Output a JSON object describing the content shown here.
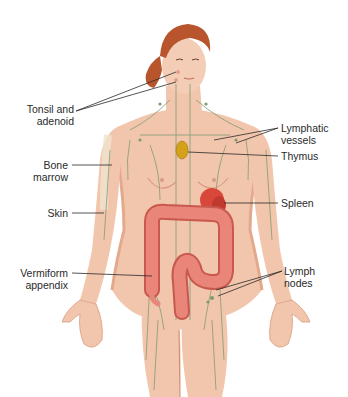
{
  "diagram": {
    "colors": {
      "skin": "#f2c6ad",
      "skin_shadow": "#e4a98c",
      "hair": "#b8552c",
      "vessel": "#7e9a72",
      "colon": "#e98579",
      "colon_dark": "#c9584e",
      "spleen": "#d9473b",
      "thymus": "#d4a21a",
      "bone": "#efe3cf",
      "leader_line": "#2a2a2a"
    },
    "labels_left": [
      {
        "id": "tonsil-adenoid",
        "text": "Tonsil and\nadenoid"
      },
      {
        "id": "bone-marrow",
        "text": "Bone\nmarrow"
      },
      {
        "id": "skin",
        "text": "Skin"
      },
      {
        "id": "vermiform-appendix",
        "text": "Vermiform\nappendix"
      }
    ],
    "labels_right": [
      {
        "id": "lymphatic-vessels",
        "text": "Lymphatic\nvessels"
      },
      {
        "id": "thymus",
        "text": "Thymus"
      },
      {
        "id": "spleen",
        "text": "Spleen"
      },
      {
        "id": "lymph-nodes",
        "text": "Lymph\nnodes"
      }
    ]
  }
}
